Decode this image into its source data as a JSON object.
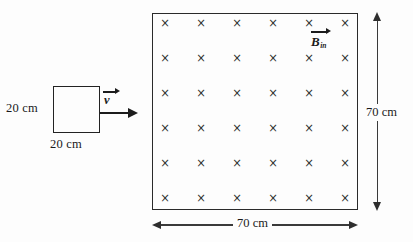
{
  "diagram": {
    "type": "physics-electromagnetic-induction",
    "background_color": "#fdfdfd",
    "stroke_color": "#2a2a2a"
  },
  "loop": {
    "name": "conducting-loop",
    "height_label": "20 cm",
    "width_label": "20 cm",
    "side_length_cm": 20,
    "shape": "square"
  },
  "velocity": {
    "symbol": "v",
    "direction": "right",
    "has_vector_arrow": true
  },
  "field": {
    "symbol": "B",
    "subscript": "in",
    "direction": "into-page",
    "marker": "×",
    "rows": 6,
    "columns": 6,
    "total_markers": 36,
    "region_shape": "square",
    "region_side_cm": 70
  },
  "dimensions": {
    "right_label": "70 cm",
    "bottom_label": "70 cm"
  },
  "chart_data": {
    "type": "scatter",
    "title": "",
    "xlabel": "",
    "ylabel": "",
    "grid_rows": 6,
    "grid_cols": 6,
    "marker_symbol": "×"
  }
}
